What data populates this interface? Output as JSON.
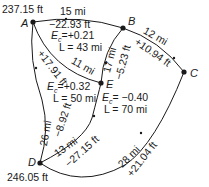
{
  "nodes": {
    "A": {
      "label": "A",
      "elevation": "237.15 ft"
    },
    "B": {
      "label": "B"
    },
    "C": {
      "label": "C"
    },
    "D": {
      "label": "D",
      "elevation": "246.05 ft"
    },
    "E": {
      "label": "E"
    }
  },
  "edges": {
    "AB": {
      "length": "15 mi",
      "diff": "−22.93 ft"
    },
    "BC": {
      "length": "12 mi",
      "diff": "+10.94 ft"
    },
    "BE": {
      "length": "17 mi",
      "diff": "−5.23 ft"
    },
    "AE": {
      "length": "11 mi",
      "diff": "+17.91 ft"
    },
    "AD": {
      "length": "26 mi",
      "diff": "−8.92 ft"
    },
    "DE": {
      "length": "13 mi",
      "diff": "−27.15 ft"
    },
    "DC": {
      "length": "28 mi",
      "diff": "+21.04 ft"
    }
  },
  "loops": {
    "ABE": {
      "ec": "Eₑ=+0.21",
      "ec_prefix": "E",
      "ec_sub": "c",
      "ec_value": "=+0.21",
      "L": "L = 43 mi"
    },
    "ADE": {
      "ec_prefix": "E",
      "ec_sub": "c",
      "ec_value": "=+0.32",
      "L": "L = 50 mi"
    },
    "BCDE": {
      "ec_prefix": "E",
      "ec_sub": "c",
      "ec_value": "= −0.40",
      "L": "L = 70 mi"
    }
  },
  "colors": {
    "line": "#1a1a1a",
    "background": "#ffffff"
  }
}
